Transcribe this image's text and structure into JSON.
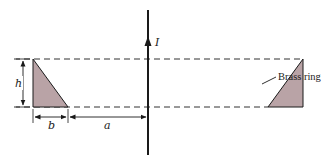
{
  "diagram": {
    "labels": {
      "current": "I",
      "height": "h",
      "base": "b",
      "distance": "a",
      "ring": "Brass ring"
    },
    "colors": {
      "stroke": "#1a1a1a",
      "fill": "#b9a3a6",
      "dashes": "#333333",
      "background": "#ffffff"
    },
    "geometry": {
      "wire_x": 148,
      "wire_y_top": 10,
      "wire_y_bottom": 155,
      "top_dashed_y": 59,
      "bottom_dashed_y": 107,
      "left_triangle": [
        [
          33,
          59
        ],
        [
          33,
          107
        ],
        [
          68,
          107
        ]
      ],
      "right_triangle": [
        [
          303,
          59
        ],
        [
          303,
          107
        ],
        [
          268,
          107
        ]
      ]
    }
  }
}
